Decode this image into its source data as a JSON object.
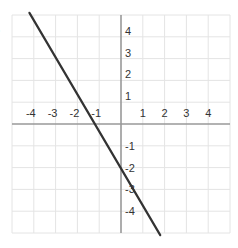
{
  "problem_marker": ")",
  "chart_data": {
    "type": "line",
    "title": "",
    "xlabel": "",
    "ylabel": "",
    "xlim": [
      -5,
      5
    ],
    "ylim": [
      -5,
      5
    ],
    "grid": true,
    "x_ticks": [
      -4,
      -3,
      -2,
      -1,
      1,
      2,
      3,
      4
    ],
    "y_ticks": [
      4,
      3,
      2,
      1,
      -1,
      -2,
      -3,
      -4
    ],
    "x_tick_labels": [
      "-4",
      "-3",
      "-2",
      "-1",
      "1",
      "2",
      "3",
      "4"
    ],
    "y_tick_labels": [
      "4",
      "3",
      "2",
      "1",
      "-1",
      "-2",
      "-3",
      "-4"
    ],
    "series": [
      {
        "name": "line",
        "color": "#333333",
        "x": [
          -4.2,
          1.8
        ],
        "y": [
          5.1,
          -5.1
        ]
      }
    ],
    "approx_x_intercept": -1.35,
    "approx_y_intercept": -2.1
  },
  "colors": {
    "grid": "#e4e4e4",
    "axis": "#999999",
    "line": "#333333",
    "label": "#333333"
  }
}
